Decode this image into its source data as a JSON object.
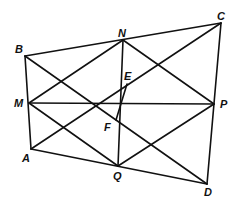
{
  "diagram": {
    "points": {
      "A": [
        31,
        149
      ],
      "B": [
        25,
        56
      ],
      "C": [
        221,
        23
      ],
      "D": [
        207,
        184
      ],
      "M": [
        29,
        103
      ],
      "N": [
        123,
        40
      ],
      "P": [
        214,
        104
      ],
      "Q": [
        118,
        166
      ],
      "E": [
        127,
        84
      ],
      "F": [
        116,
        120
      ]
    },
    "labels": [
      {
        "text": "A",
        "x": 22,
        "y": 162
      },
      {
        "text": "B",
        "x": 15,
        "y": 53
      },
      {
        "text": "C",
        "x": 217,
        "y": 20
      },
      {
        "text": "D",
        "x": 204,
        "y": 196
      },
      {
        "text": "M",
        "x": 14,
        "y": 107
      },
      {
        "text": "N",
        "x": 118,
        "y": 37
      },
      {
        "text": "P",
        "x": 220,
        "y": 108
      },
      {
        "text": "Q",
        "x": 113,
        "y": 180
      },
      {
        "text": "E",
        "x": 124,
        "y": 80
      },
      {
        "text": "F",
        "x": 104,
        "y": 131
      }
    ],
    "segments": [
      [
        "A",
        "B"
      ],
      [
        "B",
        "C"
      ],
      [
        "C",
        "D"
      ],
      [
        "D",
        "A"
      ],
      [
        "M",
        "P"
      ],
      [
        "N",
        "Q"
      ],
      [
        "M",
        "N"
      ],
      [
        "N",
        "P"
      ],
      [
        "P",
        "Q"
      ],
      [
        "Q",
        "M"
      ],
      [
        "A",
        "C"
      ],
      [
        "B",
        "D"
      ],
      [
        "E",
        "F"
      ]
    ]
  }
}
